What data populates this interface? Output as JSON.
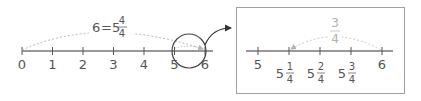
{
  "main_line": {
    "ticks": [
      "0",
      "1",
      "2",
      "3",
      "4",
      "5",
      "6"
    ],
    "equation": {
      "lhs": "6",
      "eq": "=",
      "whole": "5",
      "num": "4",
      "den": "4"
    }
  },
  "zoom_box": {
    "ticks": [
      {
        "whole": "5",
        "num": "",
        "den": ""
      },
      {
        "whole": "5",
        "num": "1",
        "den": "4"
      },
      {
        "whole": "5",
        "num": "2",
        "den": "4"
      },
      {
        "whole": "5",
        "num": "3",
        "den": "4"
      },
      {
        "whole": "6",
        "num": "",
        "den": ""
      }
    ],
    "jump_label": {
      "num": "3",
      "den": "4"
    }
  },
  "colors": {
    "line": "#333333",
    "text": "#555555",
    "dotted": "#b5b5b5",
    "box_border": "#a0a0a0"
  }
}
